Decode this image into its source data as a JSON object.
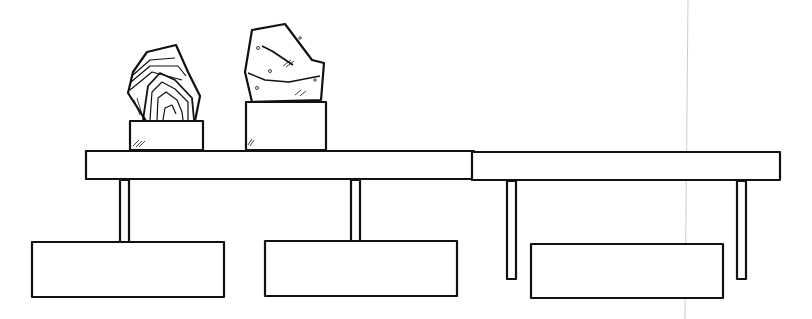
{
  "scene": {
    "description": "Line drawing of two table constructions with stone sculptures",
    "stroke_color": "#111111",
    "background": "#ffffff",
    "left_group": {
      "objects": [
        "banded-agate-stone",
        "speckled-granite-stone",
        "small-pedestal",
        "tall-pedestal",
        "table-top",
        "two-legs",
        "two-base-blocks"
      ]
    },
    "right_group": {
      "objects": [
        "table-top",
        "two-legs",
        "base-block"
      ]
    }
  }
}
